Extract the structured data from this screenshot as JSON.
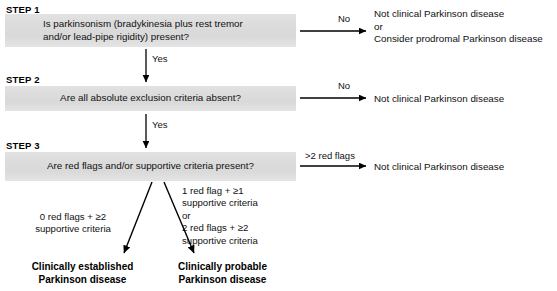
{
  "figure": {
    "steps": [
      {
        "label": "STEP 1",
        "question": "Is parkinsonism (bradykinesia plus rest tremor\nand/or lead-pipe rigidity) present?",
        "no_label": "No",
        "no_outcome": "Not clinical Parkinson disease\nor\nConsider prodromal Parkinson disease",
        "yes_label": "Yes"
      },
      {
        "label": "STEP 2",
        "question": "Are all absolute exclusion criteria absent?",
        "no_label": "No",
        "no_outcome": "Not clinical Parkinson disease",
        "yes_label": "Yes"
      },
      {
        "label": "STEP 3",
        "question": "Are red flags and/or supportive criteria present?",
        "no_label": ">2 red flags",
        "no_outcome": "Not clinical Parkinson disease"
      }
    ],
    "branches": [
      {
        "condition": "0 red flags + ≥2\nsupportive criteria",
        "result": "Clinically established\nParkinson disease"
      },
      {
        "condition": "1 red flag + ≥1\nsupportive criteria\n  or\n2 red flags + ≥2\nsupportive criteria",
        "result": "Clinically probable\nParkinson disease"
      }
    ],
    "colors": {
      "box_fill": "#dcdcdc",
      "text": "#111111",
      "arrow": "#000000",
      "background": "#ffffff"
    }
  }
}
